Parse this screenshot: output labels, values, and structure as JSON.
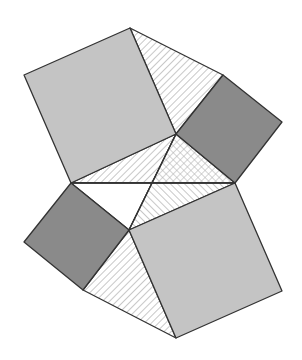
{
  "diagram": {
    "type": "geometric-figure",
    "colors": {
      "background": "#ffffff",
      "light_square": "#c4c4c4",
      "dark_square": "#8a8a8a",
      "stroke": "#333333",
      "hatch": "#b0b0b0"
    },
    "vertices": {
      "A": [
        130,
        28
      ],
      "B": [
        24,
        75
      ],
      "C": [
        71,
        183
      ],
      "D": [
        176,
        134
      ],
      "E": [
        223,
        75
      ],
      "F": [
        282,
        122
      ],
      "G": [
        235,
        183
      ],
      "H": [
        129,
        230
      ],
      "I": [
        24,
        242
      ],
      "J": [
        83,
        290
      ],
      "K": [
        176,
        338
      ],
      "L": [
        282,
        291
      ],
      "M": [
        152,
        183
      ]
    },
    "shapes": [
      {
        "name": "upper-large-square",
        "points": "130,28 24,75 71,183 176,134",
        "fill": "light"
      },
      {
        "name": "upper-small-square",
        "points": "176,134 223,75 282,122 235,183",
        "fill": "dark"
      },
      {
        "name": "lower-small-square",
        "points": "71,183 129,230 83,290 24,242",
        "fill": "dark"
      },
      {
        "name": "lower-large-square",
        "points": "129,230 235,183 282,291 176,338",
        "fill": "light"
      },
      {
        "name": "upper-hatched-triangle",
        "points": "130,28 223,75 176,134",
        "fill": "hatch-back"
      },
      {
        "name": "left-hatched-triangle",
        "points": "71,183 176,134 152,183",
        "fill": "hatch-back"
      },
      {
        "name": "center-crosshatched-triangle",
        "points": "176,134 235,183 152,183",
        "fill": "crosshatch"
      },
      {
        "name": "center-white-triangle",
        "points": "71,183 152,183 129,230",
        "fill": "white"
      },
      {
        "name": "right-hatched-triangle",
        "points": "152,183 235,183 129,230",
        "fill": "hatch-fwd"
      },
      {
        "name": "lower-hatched-triangle",
        "points": "83,290 129,230 176,338",
        "fill": "hatch-back"
      }
    ]
  }
}
